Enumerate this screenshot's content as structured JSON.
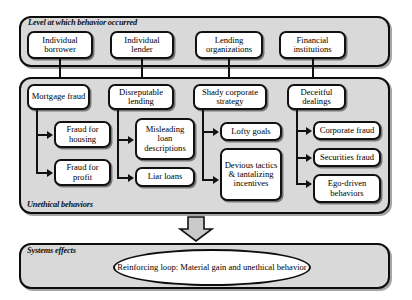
{
  "panels": {
    "level": {
      "label": "Level at which behavior occurred",
      "boxes": [
        {
          "label": "Individual borrower"
        },
        {
          "label": "Individual lender"
        },
        {
          "label": "Lending organizations"
        },
        {
          "label": "Financial institutions"
        }
      ]
    },
    "unethical": {
      "label": "Unethical behaviors",
      "columns": [
        {
          "head": "Mortgage fraud",
          "children": [
            {
              "label": "Fraud for housing"
            },
            {
              "label": "Fraud for profit"
            }
          ]
        },
        {
          "head": "Disreputable lending",
          "children": [
            {
              "label": "Misleading loan descriptions"
            },
            {
              "label": "Liar loans"
            }
          ]
        },
        {
          "head": "Shady corporate strategy",
          "children": [
            {
              "label": "Lofty goals"
            },
            {
              "label": "Devious tactics & tantalizing incentives"
            }
          ]
        },
        {
          "head": "Deceitful dealings",
          "children": [
            {
              "label": "Corporate fraud"
            },
            {
              "label": "Securities fraud"
            },
            {
              "label": "Ego-driven behaviors"
            }
          ]
        }
      ]
    },
    "systems": {
      "label": "Systems effects",
      "ellipse": "Reinforcing loop: Material gain and unethical behavior"
    }
  },
  "colors": {
    "panel_fill": "#d9d9d9",
    "box_fill": "#ffffff",
    "stroke": "#111111",
    "page_bg": "#ffffff"
  }
}
